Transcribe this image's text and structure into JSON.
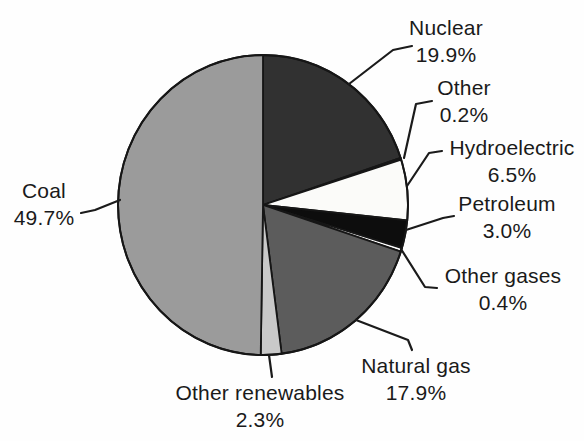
{
  "figure": {
    "background_color": "#fefefe",
    "text_color": "#1a1a1a",
    "line_color": "#1b1b1b",
    "outline_color": "#161616"
  },
  "chart_data": {
    "type": "pie",
    "title": "",
    "unit": "%",
    "start_angle_deg": 0,
    "direction": "clockwise",
    "legend": "none",
    "slices": [
      {
        "label": "Nuclear",
        "value": 19.9,
        "pct_label": "19.9%",
        "color": "#313131"
      },
      {
        "label": "Other",
        "value": 0.2,
        "pct_label": "0.2%",
        "color": "#ffffff"
      },
      {
        "label": "Hydroelectric",
        "value": 6.5,
        "pct_label": "6.5%",
        "color": "#fbfbf9"
      },
      {
        "label": "Petroleum",
        "value": 3.0,
        "pct_label": "3.0%",
        "color": "#0d0d0d"
      },
      {
        "label": "Other gases",
        "value": 0.4,
        "pct_label": "0.4%",
        "color": "#ffffff"
      },
      {
        "label": "Natural gas",
        "value": 17.9,
        "pct_label": "17.9%",
        "color": "#5c5c5c"
      },
      {
        "label": "Other renewables",
        "value": 2.3,
        "pct_label": "2.3%",
        "color": "#c9c9c9"
      },
      {
        "label": "Coal",
        "value": 49.7,
        "pct_label": "49.7%",
        "color": "#9b9b9b"
      }
    ]
  }
}
